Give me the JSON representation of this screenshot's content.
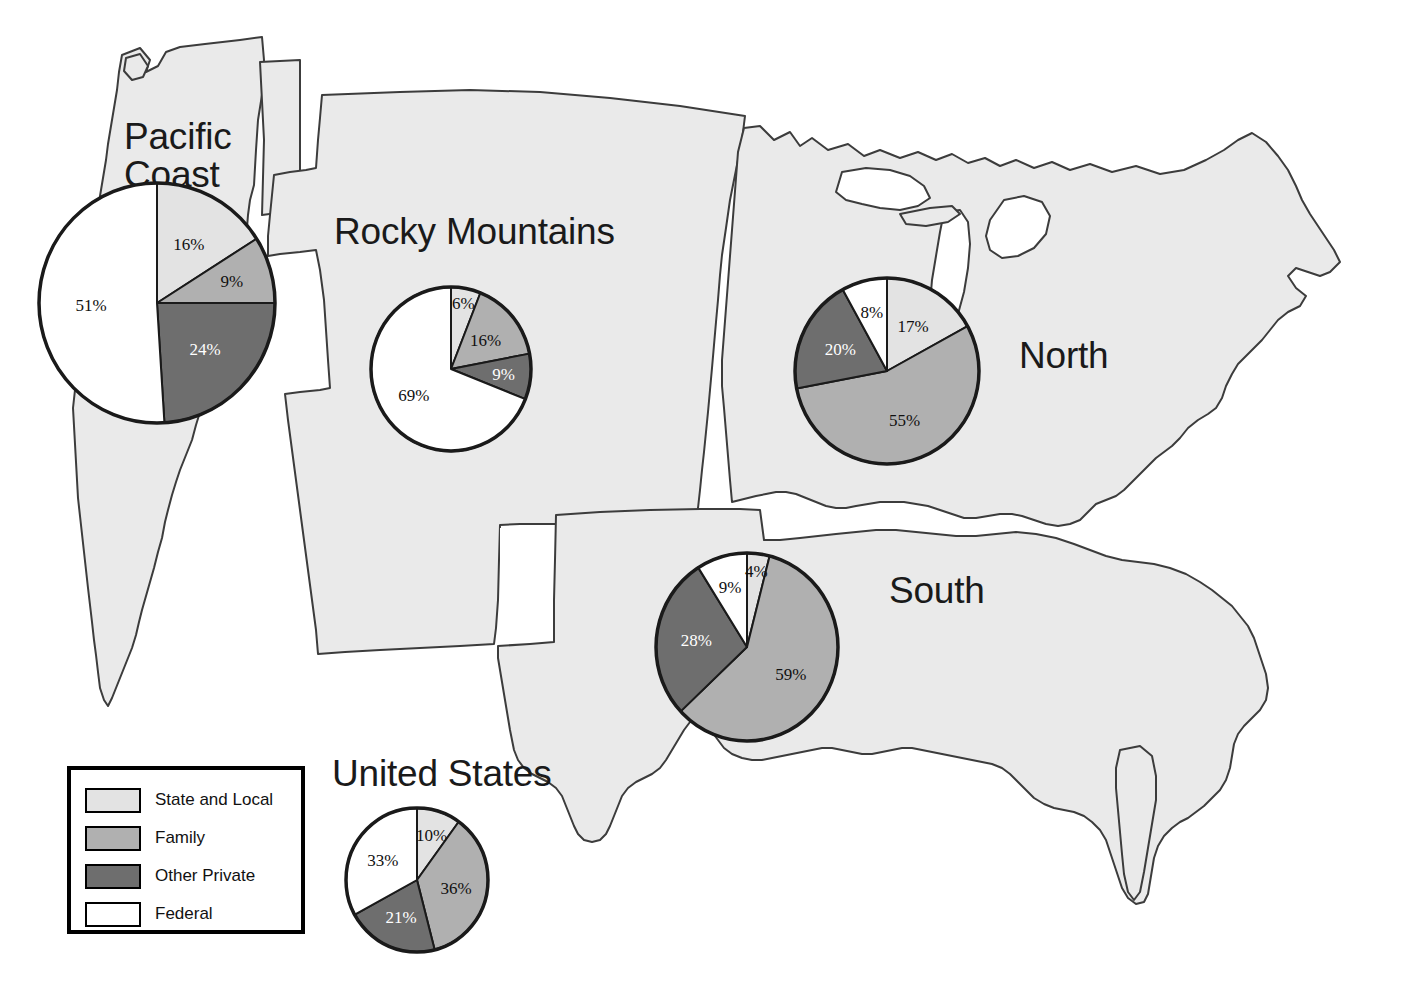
{
  "figure": {
    "background_color": "#ffffff",
    "map_fill": "#eaeaea",
    "map_stroke": "#3c3c3c"
  },
  "legend": {
    "title": "",
    "items": [
      {
        "label": "State and Local",
        "color": "#e3e3e3"
      },
      {
        "label": "Family",
        "color": "#b0b0b0"
      },
      {
        "label": "Other Private",
        "color": "#6e6e6e"
      },
      {
        "label": "Federal",
        "color": "#ffffff"
      }
    ]
  },
  "labels": {
    "pacific_coast": "Pacific\nCoast",
    "rocky_mountains": "Rocky Mountains",
    "north": "North",
    "south": "South",
    "united_states": "United States"
  },
  "chart_data": [
    {
      "type": "pie",
      "title": "Pacific Coast",
      "categories": [
        "State and Local",
        "Family",
        "Other Private",
        "Federal"
      ],
      "values": [
        16,
        9,
        24,
        51
      ],
      "labels": [
        "16%",
        "9%",
        "24%",
        "51%"
      ],
      "colors": [
        "#e3e3e3",
        "#b0b0b0",
        "#6e6e6e",
        "#ffffff"
      ],
      "start_angle_deg": 0,
      "direction": "clockwise",
      "units": "percent"
    },
    {
      "type": "pie",
      "title": "Rocky Mountains",
      "categories": [
        "State and Local",
        "Family",
        "Other Private",
        "Federal"
      ],
      "values": [
        6,
        16,
        9,
        69
      ],
      "labels": [
        "6%",
        "16%",
        "9%",
        "69%"
      ],
      "colors": [
        "#e3e3e3",
        "#b0b0b0",
        "#6e6e6e",
        "#ffffff"
      ],
      "start_angle_deg": 0,
      "direction": "clockwise",
      "units": "percent"
    },
    {
      "type": "pie",
      "title": "North",
      "categories": [
        "State and Local",
        "Family",
        "Other Private",
        "Federal"
      ],
      "values": [
        17,
        55,
        20,
        8
      ],
      "labels": [
        "17%",
        "55%",
        "20%",
        "8%"
      ],
      "colors": [
        "#e3e3e3",
        "#b0b0b0",
        "#6e6e6e",
        "#ffffff"
      ],
      "start_angle_deg": 0,
      "direction": "clockwise",
      "units": "percent"
    },
    {
      "type": "pie",
      "title": "South",
      "categories": [
        "State and Local",
        "Family",
        "Other Private",
        "Federal"
      ],
      "values": [
        4,
        59,
        28,
        9
      ],
      "labels": [
        "4%",
        "59%",
        "28%",
        "9%"
      ],
      "colors": [
        "#e3e3e3",
        "#b0b0b0",
        "#6e6e6e",
        "#ffffff"
      ],
      "start_angle_deg": 0,
      "direction": "clockwise",
      "units": "percent"
    },
    {
      "type": "pie",
      "title": "United States",
      "categories": [
        "State and Local",
        "Family",
        "Other Private",
        "Federal"
      ],
      "values": [
        10,
        36,
        21,
        33
      ],
      "labels": [
        "10%",
        "36%",
        "21%",
        "33%"
      ],
      "colors": [
        "#e3e3e3",
        "#b0b0b0",
        "#6e6e6e",
        "#ffffff"
      ],
      "start_angle_deg": 0,
      "direction": "clockwise",
      "units": "percent"
    }
  ],
  "pie_geometry": [
    {
      "key": "pacific_coast",
      "cx": 157,
      "cy": 303,
      "rx": 118,
      "ry": 120
    },
    {
      "key": "rocky_mountains",
      "cx": 451,
      "cy": 369,
      "rx": 80,
      "ry": 82
    },
    {
      "key": "north",
      "cx": 887,
      "cy": 371,
      "rx": 92,
      "ry": 93
    },
    {
      "key": "south",
      "cx": 747,
      "cy": 647,
      "rx": 91,
      "ry": 94
    },
    {
      "key": "united_states",
      "cx": 417,
      "cy": 880,
      "rx": 71,
      "ry": 72
    }
  ]
}
